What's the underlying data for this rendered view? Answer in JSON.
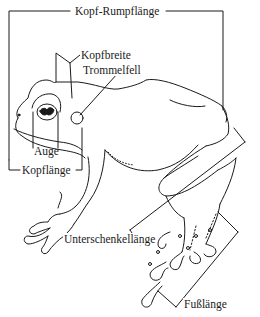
{
  "diagram": {
    "line_color": "#1a1a1a",
    "background": "#ffffff",
    "labels": {
      "kopf_rumpflaenge": "Kopf-Rumpflänge",
      "kopfbreite": "Kopfbreite",
      "trommelfell": "Trommelfell",
      "auge": "Auge",
      "kopflaenge": "Kopflänge",
      "unterschenkellaenge": "Unterschenkellänge",
      "fusslaenge": "Fußlänge"
    }
  }
}
